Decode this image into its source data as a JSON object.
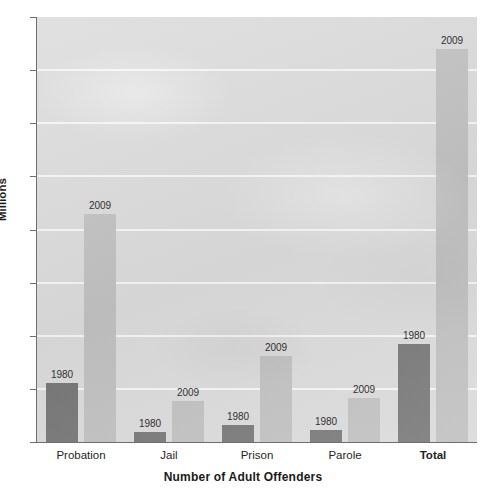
{
  "chart_data": {
    "type": "bar",
    "title": "",
    "subtitle": "",
    "xlabel": "Number of Adult Offenders",
    "ylabel": "Millions",
    "categories": [
      "Probation",
      "Jail",
      "Prison",
      "Parole",
      "Total"
    ],
    "series": [
      {
        "name": "1980",
        "values": [
          1.12,
          0.18,
          0.32,
          0.22,
          1.85
        ],
        "color": "#767676"
      },
      {
        "name": "2009",
        "values": [
          4.3,
          0.77,
          1.62,
          0.82,
          7.4
        ],
        "color": "#bfbfbf"
      }
    ],
    "ylim": [
      0,
      8
    ],
    "ytick_labels": [
      "0",
      "1",
      "2",
      "3",
      "4",
      "5",
      "6",
      "7",
      "8"
    ],
    "ytick_values": [
      0,
      1,
      2,
      3,
      4,
      5,
      6,
      7,
      8
    ],
    "grid": true,
    "grid_color": "#f4f4f4",
    "legend": false,
    "legend_position": "none",
    "data_labels": true,
    "emphasized_category": "Total",
    "plot_background": "#d9d9d9",
    "axis_color": "#6e6e6e",
    "bar_labels": [
      {
        "category": "Probation",
        "series": "1980",
        "label": "1980"
      },
      {
        "category": "Probation",
        "series": "2009",
        "label": "2009"
      },
      {
        "category": "Jail",
        "series": "1980",
        "label": "1980"
      },
      {
        "category": "Jail",
        "series": "2009",
        "label": "2009"
      },
      {
        "category": "Prison",
        "series": "1980",
        "label": "1980"
      },
      {
        "category": "Prison",
        "series": "2009",
        "label": "2009"
      },
      {
        "category": "Parole",
        "series": "1980",
        "label": "1980"
      },
      {
        "category": "Parole",
        "series": "2009",
        "label": "2009"
      },
      {
        "category": "Total",
        "series": "1980",
        "label": "1980"
      },
      {
        "category": "Total",
        "series": "2009",
        "label": "2009"
      }
    ]
  }
}
